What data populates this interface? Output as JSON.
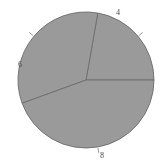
{
  "canvas": {
    "width": 163,
    "height": 166,
    "background": "#ffffff"
  },
  "style": {
    "slice_fill": "#9a9a9a",
    "slice_stroke": "#6d6d6d",
    "label_color": "#4a4a4a",
    "leader_color": "#6d6d6d"
  },
  "geometry": {
    "center_x": 86,
    "center_y": 80,
    "radius": 68
  },
  "chart_data": {
    "type": "pie",
    "title": "",
    "subtitle": "",
    "xlabel": "",
    "ylabel": "",
    "grid": false,
    "legend": "none",
    "labels": [
      "4",
      "6",
      "8"
    ],
    "values": [
      4,
      6,
      8
    ],
    "total": 18,
    "start_angle_deg": 0,
    "direction": "counterclockwise",
    "slices": [
      {
        "label": "4",
        "value": 4,
        "fraction": 0.2222,
        "angle_deg": 80,
        "start_deg": 0,
        "end_deg": 80,
        "color": "#9a9a9a",
        "label_x": 116,
        "label_y": 9
      },
      {
        "label": "6",
        "value": 6,
        "fraction": 0.3333,
        "angle_deg": 120,
        "start_deg": 80,
        "end_deg": 200,
        "color": "#9a9a9a",
        "label_x": 18,
        "label_y": 61
      },
      {
        "label": "8",
        "value": 8,
        "fraction": 0.4444,
        "angle_deg": 160,
        "start_deg": 200,
        "end_deg": 360,
        "color": "#9a9a9a",
        "label_x": 100,
        "label_y": 152
      }
    ]
  }
}
